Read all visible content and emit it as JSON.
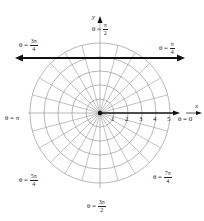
{
  "diagram": {
    "type": "polar-grid",
    "center": {
      "x": 100,
      "y": 113
    },
    "circle_radii_px": [
      14,
      28,
      42,
      56,
      70
    ],
    "radial_step_degrees": 15,
    "grid_color": "#9a9a9a",
    "axis_color": "#111111",
    "highlight_line": {
      "y": 58,
      "x_from": 16,
      "x_to": 184,
      "color": "#111111"
    },
    "axes": {
      "x_label": "x",
      "y_label": "y"
    },
    "ticks": [
      "1",
      "2",
      "3",
      "4",
      "5"
    ],
    "angle_labels": {
      "theta_0": {
        "prefix": "θ = ",
        "value": "0"
      },
      "theta_pi": {
        "prefix": "θ = ",
        "value": "π"
      },
      "theta_pi_2": {
        "prefix": "θ = ",
        "num": "π",
        "den": "2"
      },
      "theta_pi_4": {
        "prefix": "θ = ",
        "num": "π",
        "den": "4"
      },
      "theta_3pi_4": {
        "prefix": "θ = ",
        "num": "3π",
        "den": "4"
      },
      "theta_5pi_4": {
        "prefix": "θ = ",
        "num": "5π",
        "den": "4"
      },
      "theta_3pi_2": {
        "prefix": "θ = ",
        "num": "3π",
        "den": "2"
      },
      "theta_7pi_4": {
        "prefix": "θ = ",
        "num": "7π",
        "den": "4"
      }
    }
  }
}
